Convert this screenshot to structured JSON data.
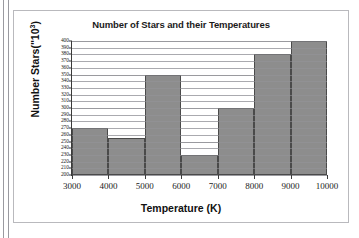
{
  "chart_data": {
    "type": "bar",
    "title": "Number of Stars and their Temperatures",
    "xlabel": "Temperature (K)",
    "ylabel_prefix": "Number Stars(\"10",
    "ylabel_exponent": "3",
    "ylabel_suffix": ")",
    "ylabel_full": "Number Stars(\"10³)",
    "categories": [
      "3000-4000",
      "4000-5000",
      "5000-6000",
      "6000-7000",
      "7000-8000",
      "8000-9000",
      "9000-10000"
    ],
    "bin_edges": [
      3000,
      4000,
      5000,
      6000,
      7000,
      8000,
      9000,
      10000
    ],
    "values": [
      270,
      255,
      350,
      230,
      300,
      380,
      400
    ],
    "xlim": [
      3000,
      10000
    ],
    "ylim": [
      200,
      400
    ],
    "ytick_step": 10,
    "xtick_step": 1000,
    "xticks": [
      "3000",
      "4000",
      "5000",
      "6000",
      "7000",
      "8000",
      "9000",
      "10000"
    ],
    "yticks": [
      "400",
      "390",
      "380",
      "370",
      "360",
      "350",
      "340",
      "330",
      "320",
      "310",
      "300",
      "290",
      "280",
      "270",
      "260",
      "250",
      "240",
      "230",
      "220",
      "210",
      "200"
    ],
    "grid": true,
    "legend": false,
    "bar_color": "#8d8d8d",
    "bar_edge_color": "#4a4a4a",
    "grid_color": "#c4c4c8",
    "axis_color": "#3b3b3b",
    "background_color": "#ffffff"
  }
}
